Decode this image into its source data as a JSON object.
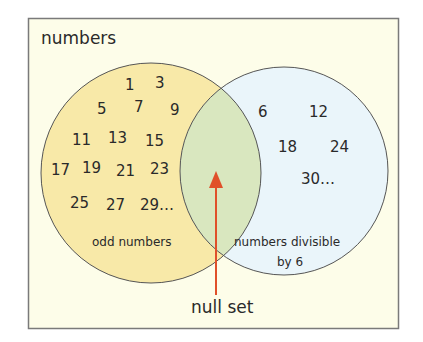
{
  "title": "numbers",
  "colors": {
    "frame_bg": "#fdfde9",
    "frame_border": "#7a7a7a",
    "left_fill": "#f8e9a8",
    "right_fill": "#eaf5fa",
    "overlap_fill": "#d9e7bf",
    "circle_stroke": "#555555",
    "arrow": "#e0502a"
  },
  "left_set": {
    "label": "odd numbers",
    "members": [
      "1",
      "3",
      "5",
      "7",
      "9",
      "11",
      "13",
      "15",
      "17",
      "19",
      "21",
      "23",
      "25",
      "27",
      "29…"
    ]
  },
  "right_set": {
    "label_line1": "numbers divisible",
    "label_line2": "by 6",
    "members": [
      "6",
      "12",
      "18",
      "24",
      "30…"
    ]
  },
  "intersection": {
    "label": "null set"
  }
}
